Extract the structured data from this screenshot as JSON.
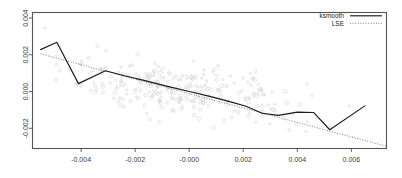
{
  "chart_data": {
    "type": "scatter",
    "title": "",
    "subtitle": "",
    "xlabel": "",
    "ylabel": "",
    "xlim": [
      -0.0058,
      0.0073
    ],
    "ylim": [
      -0.0031,
      0.0043
    ],
    "grid": false,
    "legend_position": "top-right",
    "x_ticks": [
      -0.004,
      -0.002,
      -0.0,
      0.002,
      0.004,
      0.006
    ],
    "x_tick_labels": [
      "-0.004",
      "-0.002",
      "-0.000",
      "0.002",
      "0.004",
      "0.006"
    ],
    "y_ticks": [
      0.004,
      0.002,
      0.0,
      -0.002
    ],
    "y_tick_labels": [
      "0.004",
      "0.002",
      "0.000",
      "-0.002"
    ],
    "legend": [
      {
        "name": "ksmooth",
        "style": "solid",
        "color": "#1b1b1b"
      },
      {
        "name": "LSE",
        "style": "dotted",
        "color": "#6b6b6b"
      }
    ],
    "series": [
      {
        "name": "ksmooth",
        "style": "solid",
        "x": [
          -0.0055,
          -0.0049,
          -0.0041,
          -0.0031,
          -0.0024,
          -0.0016,
          -0.0008,
          0.0,
          0.0008,
          0.0015,
          0.0021,
          0.0027,
          0.0033,
          0.004,
          0.0046,
          0.0052,
          0.0065
        ],
        "y": [
          0.00228,
          0.00268,
          0.00043,
          0.00113,
          0.00086,
          0.00058,
          0.00028,
          0.0,
          -0.00028,
          -0.00055,
          -0.0008,
          -0.00118,
          -0.0013,
          -0.00112,
          -0.00114,
          -0.00208,
          -0.00078
        ]
      },
      {
        "name": "LSE",
        "style": "dotted",
        "x": [
          -0.0055,
          0.0073
        ],
        "y": [
          0.00205,
          -0.00298
        ]
      }
    ],
    "scatter": {
      "name": "observations",
      "marker": "open-circle",
      "color": "#cfcfcf",
      "n_points": 268,
      "x_center": -0.0004,
      "y_center": 0.0001,
      "x_spread": 0.0021,
      "y_spread": 0.00085,
      "correlation": -0.55
    }
  },
  "axes": {
    "x_tick_labels": [
      "-0.004",
      "-0.002",
      "-0.000",
      "0.002",
      "0.004",
      "0.006"
    ],
    "y_tick_labels": [
      "0.004",
      "0.002",
      "0.000",
      "-0.002"
    ]
  },
  "legend": {
    "entries": [
      {
        "label": "ksmooth"
      },
      {
        "label": "LSE"
      }
    ]
  }
}
